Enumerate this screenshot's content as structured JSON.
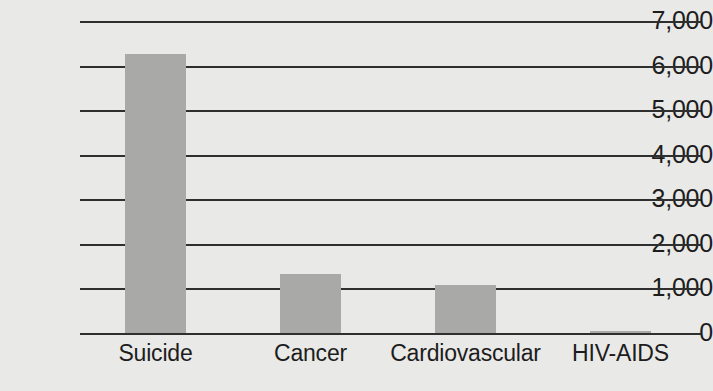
{
  "chart_data": {
    "type": "bar",
    "title": "",
    "xlabel": "",
    "ylabel": "",
    "categories": [
      "Suicide",
      "Cancer",
      "Cardiovascular",
      "HIV-AIDS"
    ],
    "values": [
      6250,
      1320,
      1070,
      40
    ],
    "ylim": [
      0,
      7000
    ],
    "yticks": [
      0,
      1000,
      2000,
      3000,
      4000,
      5000,
      6000,
      7000
    ],
    "ytick_labels": [
      "0",
      "1,000",
      "2,000",
      "3,000",
      "4,000",
      "5,000",
      "6,000",
      "7,000"
    ],
    "grid": true,
    "grid_axis": "y",
    "legend": false,
    "legend_position": "none",
    "bar_color": "#a9a9a7",
    "gridline_color": "#2f2f2f",
    "background_color": "#e9e9e7",
    "text_color": "#1d1d1d"
  },
  "axes": {
    "y": {
      "ticks": [
        {
          "label": "7,000",
          "value": 7000
        },
        {
          "label": "6,000",
          "value": 6000
        },
        {
          "label": "5,000",
          "value": 5000
        },
        {
          "label": "4,000",
          "value": 4000
        },
        {
          "label": "3,000",
          "value": 3000
        },
        {
          "label": "2,000",
          "value": 2000
        },
        {
          "label": "1,000",
          "value": 1000
        },
        {
          "label": "0",
          "value": 0
        }
      ]
    },
    "x": {
      "ticks": [
        {
          "label": "Suicide"
        },
        {
          "label": "Cancer"
        },
        {
          "label": "Cardiovascular"
        },
        {
          "label": "HIV-AIDS"
        }
      ]
    }
  }
}
